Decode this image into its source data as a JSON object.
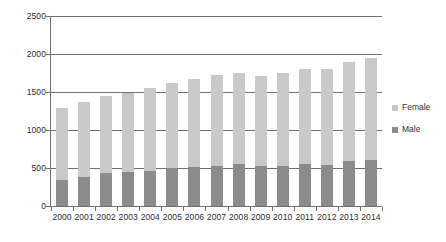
{
  "chart_data": {
    "type": "bar",
    "title": "",
    "subtitle": "",
    "xlabel": "",
    "ylabel": "",
    "stacked": true,
    "orientation": "vertical",
    "grid": true,
    "gridlines_axis": "y",
    "legend_position": "right",
    "ylim": [
      0,
      2500
    ],
    "yticks": [
      0,
      500,
      1000,
      1500,
      2000,
      2500
    ],
    "ytick_labels": [
      "0",
      "500",
      "1000",
      "1500",
      "2000",
      "2500"
    ],
    "categories": [
      "2000",
      "2001",
      "2002",
      "2003",
      "2004",
      "2005",
      "2006",
      "2007",
      "2008",
      "2009",
      "2010",
      "2011",
      "2012",
      "2013",
      "2014"
    ],
    "xtick_labels": [
      "2000",
      "2001",
      "2002",
      "2003",
      "2004",
      "2005",
      "2006",
      "2007",
      "2008",
      "2009",
      "2010",
      "2011",
      "2012",
      "2013",
      "2014"
    ],
    "series": [
      {
        "name": "Male",
        "color": "#8b8b8b",
        "values": [
          340,
          385,
          430,
          445,
          465,
          500,
          515,
          530,
          555,
          520,
          530,
          555,
          545,
          590,
          610
        ]
      },
      {
        "name": "Female",
        "color": "#c9c9c9",
        "values": [
          950,
          985,
          1020,
          1045,
          1090,
          1125,
          1150,
          1195,
          1200,
          1195,
          1225,
          1245,
          1255,
          1300,
          1340
        ]
      }
    ],
    "totals": [
      1290,
      1370,
      1450,
      1490,
      1555,
      1625,
      1665,
      1725,
      1755,
      1715,
      1755,
      1800,
      1800,
      1890,
      1950
    ],
    "legend": [
      {
        "label": "Female",
        "color": "#c9c9c9"
      },
      {
        "label": "Male",
        "color": "#8b8b8b"
      }
    ],
    "colors": {
      "female": "#c9c9c9",
      "male": "#8b8b8b",
      "axis": "#6f6f6f",
      "text": "#2e2e2e",
      "background": "#ffffff"
    }
  }
}
